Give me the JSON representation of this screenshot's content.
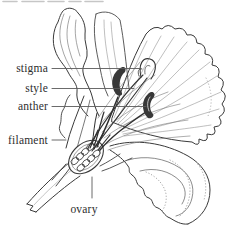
{
  "figure": {
    "type": "botanical-line-drawing",
    "background_color": "#ffffff",
    "ink_color": "#3a3a3a",
    "vein_color": "#8a8a8a",
    "leader_line_color": "#5a5a5a",
    "labels": [
      {
        "id": "stigma",
        "text": "stigma"
      },
      {
        "id": "style",
        "text": "style"
      },
      {
        "id": "anther",
        "text": "anther"
      },
      {
        "id": "filament",
        "text": "filament"
      },
      {
        "id": "ovary",
        "text": "ovary"
      }
    ]
  }
}
